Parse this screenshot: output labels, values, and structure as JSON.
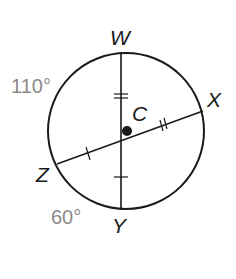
{
  "diagram": {
    "type": "circle-chords",
    "center_label": "C",
    "points": {
      "W": "W",
      "X": "X",
      "Y": "Y",
      "Z": "Z"
    },
    "arc_measures": {
      "arc_WZ": "110°",
      "arc_ZY": "60°"
    },
    "chords": [
      "WY",
      "ZX"
    ],
    "congruence_marks": {
      "CW": "double tick",
      "CX": "double tick",
      "CZ": "single tick",
      "CY": "single tick"
    },
    "colors": {
      "stroke": "#1a1a1a",
      "arc_label": "#8a8a8a"
    }
  }
}
